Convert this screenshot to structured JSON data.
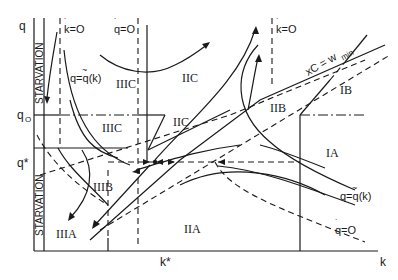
{
  "figure": {
    "type": "phase-diagram",
    "axes": {
      "x_label": "k",
      "y_label": "q",
      "x_marks": [
        "k*"
      ],
      "y_marks": [
        "q0",
        "q*"
      ]
    },
    "labels": {
      "y_axis": "q",
      "x_axis": "k",
      "q0": "q",
      "q0_sub": "O",
      "q_star": "q*",
      "k_star": "k*",
      "starvation_top": "STARVATION",
      "starvation_bottom": "STARVATION",
      "kdot_zero_left": "k=O",
      "kdot_zero_right": "k=O",
      "qdot_zero_top": "q=O",
      "qdot_zero_bottom": "q=O",
      "q_tilde_top": "q=q(k)",
      "q_tilde_bottom": "q=q(k)",
      "xc_wmin": "xC = w",
      "wmin_sub": "min"
    },
    "regions": {
      "IIIC_top": "IIIC",
      "IIC_top": "IIC",
      "IIIC_mid": "IIIC",
      "IIC_mid": "IIC",
      "IIB": "IIB",
      "IB": "IB",
      "IA": "IA",
      "IIIB": "IIIB",
      "IIIA": "IIIA",
      "IIA": "IIA"
    },
    "colors": {
      "ink": "#1a1a1a",
      "background": "#ffffff"
    }
  }
}
